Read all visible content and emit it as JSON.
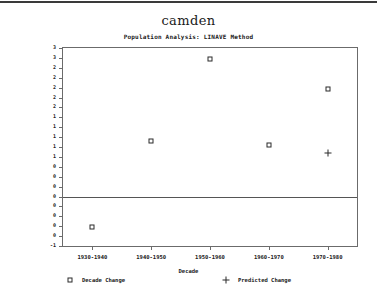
{
  "chart_data": {
    "type": "scatter",
    "title": "camden",
    "subtitle": "Population Analysis:  LINAVE Method",
    "xlabel": "Decade",
    "ylabel": "Actual Population Change (Thousands)",
    "categories": [
      "1930-1940",
      "1940-1950",
      "1950-1960",
      "1960-1970",
      "1970-1980"
    ],
    "ylim": [
      -1.0,
      3.0
    ],
    "yticks": [
      3.0,
      2.8,
      2.6,
      2.4,
      2.2,
      2.0,
      1.8,
      1.6,
      1.4,
      1.2,
      1.0,
      0.8,
      0.6,
      0.4,
      0.2,
      0.0,
      -0.2,
      -0.4,
      -0.6,
      -0.8,
      -1.0
    ],
    "ytick_labels": [
      "3",
      "3",
      "2",
      "2",
      "2",
      "2",
      "2",
      "1",
      "1",
      "1",
      "1",
      "1",
      "0",
      "0",
      "0",
      "0",
      "0",
      "0",
      "0",
      "0",
      "-1"
    ],
    "grid": false,
    "zero_line": 0.0,
    "legend_position": "bottom",
    "series": [
      {
        "name": "Decade Change",
        "marker": "square",
        "values": [
          -0.62,
          1.12,
          2.78,
          1.05,
          2.18
        ]
      },
      {
        "name": "Predicted Change",
        "marker": "plus",
        "values": [
          null,
          null,
          null,
          null,
          0.88
        ]
      }
    ]
  },
  "legend": {
    "items": [
      {
        "label": "Decade Change",
        "marker": "square"
      },
      {
        "label": "Predicted Change",
        "marker": "plus"
      }
    ]
  }
}
